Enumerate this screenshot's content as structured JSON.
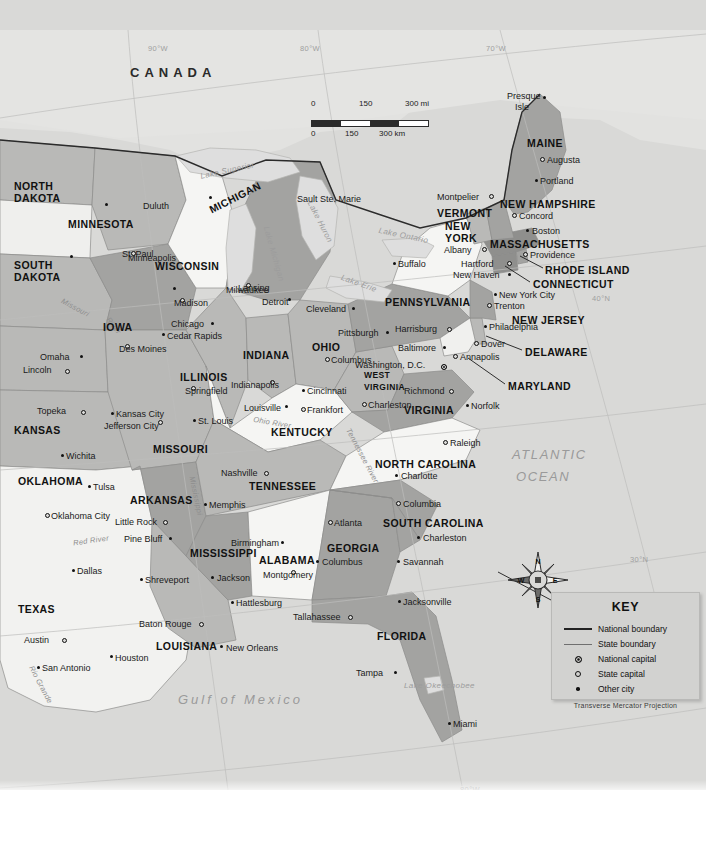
{
  "map": {
    "title_country": "CANADA",
    "oceans": [
      {
        "name": "ATLANTIC\nOCEAN",
        "line1": "ATLANTIC",
        "line2": "OCEAN",
        "x": 512,
        "y": 448
      },
      {
        "name": "Gulf of Mexico",
        "x": 178,
        "y": 693
      }
    ],
    "graticule_labels": [
      {
        "label": "90°W",
        "x": 148,
        "y": 45
      },
      {
        "label": "80°W",
        "x": 300,
        "y": 45
      },
      {
        "label": "70°W",
        "x": 486,
        "y": 45
      },
      {
        "label": "40°N",
        "x": 592,
        "y": 295
      },
      {
        "label": "30°N",
        "x": 630,
        "y": 556
      },
      {
        "label": "90°W",
        "x": 228,
        "y": 790
      },
      {
        "label": "80°W",
        "x": 460,
        "y": 786
      }
    ],
    "lakes": [
      {
        "label": "Lake Superior",
        "x": 200,
        "y": 167,
        "rot": -12
      },
      {
        "label": "Lake Michigan",
        "x": 245,
        "y": 250,
        "rot": 74
      },
      {
        "label": "Lake Huron",
        "x": 297,
        "y": 218,
        "rot": 63
      },
      {
        "label": "Lake Erie",
        "x": 340,
        "y": 280,
        "rot": 20
      },
      {
        "label": "Lake Ontario",
        "x": 378,
        "y": 232,
        "rot": 12
      },
      {
        "label": "Lake Okeechobee",
        "x": 404,
        "y": 682,
        "rot": 0
      }
    ],
    "rivers": [
      {
        "label": "Missouri",
        "x": 60,
        "y": 304,
        "rot": 28
      },
      {
        "label": "River",
        "x": 104,
        "y": 322,
        "rot": 52
      },
      {
        "label": "Mississippi",
        "x": 176,
        "y": 492,
        "rot": 78
      },
      {
        "label": "Ohio River",
        "x": 253,
        "y": 419,
        "rot": 10
      },
      {
        "label": "Tennessee River",
        "x": 332,
        "y": 452,
        "rot": 62
      },
      {
        "label": "Red River",
        "x": 73,
        "y": 537,
        "rot": -8
      },
      {
        "label": "Rio Grande",
        "x": 20,
        "y": 681,
        "rot": 62
      }
    ],
    "compass": {
      "n": "N",
      "e": "E",
      "s": "S",
      "w": "W",
      "x": 538,
      "y": 580
    }
  },
  "scale": {
    "miles": {
      "zero": "0",
      "mid": "150",
      "max": "300 mi"
    },
    "km": {
      "zero": "0",
      "mid": "150",
      "max": "300 km"
    }
  },
  "key": {
    "title": "KEY",
    "items": [
      {
        "symbol": "national-boundary-line",
        "label": "National boundary"
      },
      {
        "symbol": "state-boundary-line",
        "label": "State boundary"
      },
      {
        "symbol": "national-capital-dot",
        "label": "National capital"
      },
      {
        "symbol": "state-capital-dot",
        "label": "State capital"
      },
      {
        "symbol": "other-city-dot",
        "label": "Other city"
      }
    ],
    "projection": "Transverse Mercator Projection"
  },
  "states": [
    {
      "name": "NORTH\nDAKOTA",
      "l1": "NORTH",
      "l2": "DAKOTA",
      "x": 14,
      "y": 181,
      "two": true
    },
    {
      "name": "SOUTH\nDAKOTA",
      "l1": "SOUTH",
      "l2": "DAKOTA",
      "x": 14,
      "y": 260,
      "two": true
    },
    {
      "name": "MINNESOTA",
      "x": 68,
      "y": 219,
      "two": false
    },
    {
      "name": "WISCONSIN",
      "x": 155,
      "y": 261,
      "two": false
    },
    {
      "name": "MICHIGAN",
      "x": 210,
      "y": 205,
      "two": false,
      "rot": -27
    },
    {
      "name": "IOWA",
      "x": 103,
      "y": 322,
      "two": false
    },
    {
      "name": "ILLINOIS",
      "x": 180,
      "y": 372,
      "two": false
    },
    {
      "name": "INDIANA",
      "x": 243,
      "y": 350,
      "two": false
    },
    {
      "name": "OHIO",
      "x": 312,
      "y": 342,
      "two": false
    },
    {
      "name": "KANSAS",
      "x": 14,
      "y": 425,
      "two": false
    },
    {
      "name": "MISSOURI",
      "x": 153,
      "y": 444,
      "two": false
    },
    {
      "name": "KENTUCKY",
      "x": 271,
      "y": 427,
      "two": false
    },
    {
      "name": "WEST\nVIRGINIA",
      "l1": "WEST",
      "l2": "VIRGINIA",
      "x": 364,
      "y": 371,
      "two": true,
      "small": true
    },
    {
      "name": "VIRGINIA",
      "x": 404,
      "y": 405,
      "two": false
    },
    {
      "name": "PENNSYLVANIA",
      "x": 385,
      "y": 297,
      "two": false
    },
    {
      "name": "NEW\nYORK",
      "l1": "NEW",
      "l2": "YORK",
      "x": 445,
      "y": 221,
      "two": true
    },
    {
      "name": "VERMONT",
      "x": 437,
      "y": 208,
      "two": false
    },
    {
      "name": "NEW HAMPSHIRE",
      "x": 500,
      "y": 199,
      "two": false
    },
    {
      "name": "MAINE",
      "x": 527,
      "y": 138,
      "two": false
    },
    {
      "name": "MASSACHUSETTS",
      "x": 490,
      "y": 239,
      "two": false
    },
    {
      "name": "RHODE ISLAND",
      "x": 545,
      "y": 265,
      "two": false
    },
    {
      "name": "CONNECTICUT",
      "x": 533,
      "y": 279,
      "two": false
    },
    {
      "name": "NEW JERSEY",
      "x": 512,
      "y": 315,
      "two": false
    },
    {
      "name": "DELAWARE",
      "x": 525,
      "y": 347,
      "two": false
    },
    {
      "name": "MARYLAND",
      "x": 508,
      "y": 381,
      "two": false
    },
    {
      "name": "NORTH CAROLINA",
      "x": 375,
      "y": 459,
      "two": false
    },
    {
      "name": "SOUTH CAROLINA",
      "x": 383,
      "y": 518,
      "two": false
    },
    {
      "name": "GEORGIA",
      "x": 327,
      "y": 543,
      "two": false
    },
    {
      "name": "FLORIDA",
      "x": 377,
      "y": 631,
      "two": false
    },
    {
      "name": "TENNESSEE",
      "x": 249,
      "y": 481,
      "two": false
    },
    {
      "name": "ALABAMA",
      "x": 259,
      "y": 555,
      "two": false
    },
    {
      "name": "MISSISSIPPI",
      "x": 190,
      "y": 548,
      "two": false
    },
    {
      "name": "LOUISIANA",
      "x": 156,
      "y": 641,
      "two": false
    },
    {
      "name": "ARKANSAS",
      "x": 130,
      "y": 495,
      "two": false
    },
    {
      "name": "OKLAHOMA",
      "x": 18,
      "y": 476,
      "two": false
    },
    {
      "name": "TEXAS",
      "x": 18,
      "y": 604,
      "two": false
    }
  ],
  "cities": [
    {
      "name": "Duluth",
      "type": "other",
      "x": 105,
      "y": 203,
      "dx": 38,
      "dy": 4
    },
    {
      "name": "Sault Ste. Marie",
      "type": "other",
      "x": 209,
      "y": 196,
      "dx": 88,
      "dy": 4
    },
    {
      "name": "Minneapolis",
      "type": "other",
      "x": 70,
      "y": 255,
      "dx": 58,
      "dy": 4
    },
    {
      "name": "St. Paul",
      "type": "state",
      "x": 131,
      "y": 251,
      "dx": -9,
      "dy": 4
    },
    {
      "name": "Milwaukee",
      "type": "other",
      "x": 173,
      "y": 287,
      "dx": 53,
      "dy": 4
    },
    {
      "name": "Madison",
      "type": "state",
      "x": 180,
      "y": 298,
      "dx": -6,
      "dy": 6
    },
    {
      "name": "Lansing",
      "type": "state",
      "x": 246,
      "y": 283,
      "dx": -8,
      "dy": 6
    },
    {
      "name": "Detroit",
      "type": "other",
      "x": 288,
      "y": 298,
      "dx": -26,
      "dy": 5
    },
    {
      "name": "Chicago",
      "type": "other",
      "x": 211,
      "y": 322,
      "dx": -40,
      "dy": 3
    },
    {
      "name": "Cedar Rapids",
      "type": "other",
      "x": 162,
      "y": 333,
      "dx": 5,
      "dy": 4
    },
    {
      "name": "Des Moines",
      "type": "state",
      "x": 125,
      "y": 344,
      "dx": -6,
      "dy": 6
    },
    {
      "name": "Omaha",
      "type": "other",
      "x": 80,
      "y": 355,
      "dx": -40,
      "dy": 3
    },
    {
      "name": "Lincoln",
      "type": "state",
      "x": 65,
      "y": 369,
      "dx": -42,
      "dy": 2
    },
    {
      "name": "Topeka",
      "type": "state",
      "x": 81,
      "y": 410,
      "dx": -44,
      "dy": 2
    },
    {
      "name": "Kansas City",
      "type": "other",
      "x": 111,
      "y": 412,
      "dx": 5,
      "dy": 3
    },
    {
      "name": "Jefferson City",
      "type": "state",
      "x": 158,
      "y": 420,
      "dx": -54,
      "dy": 7
    },
    {
      "name": "St. Louis",
      "type": "other",
      "x": 193,
      "y": 419,
      "dx": 5,
      "dy": 3
    },
    {
      "name": "Springfield",
      "type": "state",
      "x": 191,
      "y": 386,
      "dx": -6,
      "dy": 6
    },
    {
      "name": "Wichita",
      "type": "other",
      "x": 61,
      "y": 454,
      "dx": 5,
      "dy": 3
    },
    {
      "name": "Indianapolis",
      "type": "state",
      "x": 270,
      "y": 380,
      "dx": -39,
      "dy": 6
    },
    {
      "name": "Cincinnati",
      "type": "other",
      "x": 302,
      "y": 389,
      "dx": 5,
      "dy": 3
    },
    {
      "name": "Louisville",
      "type": "other",
      "x": 285,
      "y": 405,
      "dx": -41,
      "dy": 4
    },
    {
      "name": "Frankfort",
      "type": "state",
      "x": 301,
      "y": 407,
      "dx": 6,
      "dy": 4
    },
    {
      "name": "Columbus",
      "type": "state",
      "x": 325,
      "y": 357,
      "dx": 6,
      "dy": 4
    },
    {
      "name": "Charleston",
      "type": "state",
      "x": 362,
      "y": 402,
      "dx": 6,
      "dy": 4
    },
    {
      "name": "Nashville",
      "type": "state",
      "x": 264,
      "y": 471,
      "dx": -43,
      "dy": 3
    },
    {
      "name": "Memphis",
      "type": "other",
      "x": 204,
      "y": 503,
      "dx": 5,
      "dy": 3
    },
    {
      "name": "Little Rock",
      "type": "state",
      "x": 163,
      "y": 520,
      "dx": -48,
      "dy": 3
    },
    {
      "name": "Pine Bluff",
      "type": "other",
      "x": 169,
      "y": 537,
      "dx": -45,
      "dy": 3
    },
    {
      "name": "Tulsa",
      "type": "other",
      "x": 88,
      "y": 485,
      "dx": 5,
      "dy": 3
    },
    {
      "name": "Oklahoma City",
      "type": "state",
      "x": 45,
      "y": 513,
      "dx": 6,
      "dy": 4
    },
    {
      "name": "Dallas",
      "type": "other",
      "x": 72,
      "y": 569,
      "dx": 5,
      "dy": 3
    },
    {
      "name": "Austin",
      "type": "state",
      "x": 62,
      "y": 638,
      "dx": -38,
      "dy": 3
    },
    {
      "name": "San Antonio",
      "type": "other",
      "x": 37,
      "y": 666,
      "dx": 5,
      "dy": 3
    },
    {
      "name": "Houston",
      "type": "other",
      "x": 110,
      "y": 655,
      "dx": 5,
      "dy": 4
    },
    {
      "name": "Shreveport",
      "type": "other",
      "x": 140,
      "y": 578,
      "dx": 5,
      "dy": 3
    },
    {
      "name": "Baton Rouge",
      "type": "state",
      "x": 199,
      "y": 622,
      "dx": -60,
      "dy": 3
    },
    {
      "name": "New Orleans",
      "type": "other",
      "x": 220,
      "y": 645,
      "dx": 6,
      "dy": 4
    },
    {
      "name": "Jackson",
      "type": "other",
      "x": 211,
      "y": 576,
      "dx": 6,
      "dy": 3
    },
    {
      "name": "Birmingham",
      "type": "other",
      "x": 281,
      "y": 541,
      "dx": -50,
      "dy": 3
    },
    {
      "name": "Montgomery",
      "type": "state",
      "x": 291,
      "y": 570,
      "dx": -28,
      "dy": 6
    },
    {
      "name": "Hattlesburg",
      "type": "other",
      "x": 231,
      "y": 601,
      "dx": 5,
      "dy": 3
    },
    {
      "name": "Tallahassee",
      "type": "state",
      "x": 348,
      "y": 615,
      "dx": -55,
      "dy": 3
    },
    {
      "name": "Jacksonville",
      "type": "other",
      "x": 398,
      "y": 600,
      "dx": 5,
      "dy": 3
    },
    {
      "name": "Tampa",
      "type": "other",
      "x": 394,
      "y": 671,
      "dx": -38,
      "dy": 3
    },
    {
      "name": "Miami",
      "type": "other",
      "x": 448,
      "y": 722,
      "dx": 5,
      "dy": 3
    },
    {
      "name": "Atlanta",
      "type": "state",
      "x": 328,
      "y": 520,
      "dx": 6,
      "dy": 4
    },
    {
      "name": "Columbus",
      "type": "other",
      "x": 316,
      "y": 560,
      "dx": 6,
      "dy": 3
    },
    {
      "name": "Savannah",
      "type": "other",
      "x": 397,
      "y": 560,
      "dx": 6,
      "dy": 3
    },
    {
      "name": "Charleston",
      "type": "other",
      "x": 417,
      "y": 536,
      "dx": 6,
      "dy": 3
    },
    {
      "name": "Columbia",
      "type": "state",
      "x": 396,
      "y": 501,
      "dx": 7,
      "dy": 4
    },
    {
      "name": "Charlotte",
      "type": "other",
      "x": 395,
      "y": 474,
      "dx": 6,
      "dy": 3
    },
    {
      "name": "Raleigh",
      "type": "state",
      "x": 443,
      "y": 440,
      "dx": 7,
      "dy": 4
    },
    {
      "name": "Richmond",
      "type": "state",
      "x": 449,
      "y": 389,
      "dx": -45,
      "dy": 3
    },
    {
      "name": "Norfolk",
      "type": "other",
      "x": 466,
      "y": 404,
      "dx": 5,
      "dy": 3
    },
    {
      "name": "Washington, D.C.",
      "type": "natl",
      "x": 441,
      "y": 364,
      "dx": -86,
      "dy": 2
    },
    {
      "name": "Annapolis",
      "type": "state",
      "x": 453,
      "y": 354,
      "dx": 7,
      "dy": 4
    },
    {
      "name": "Baltimore",
      "type": "other",
      "x": 443,
      "y": 346,
      "dx": -45,
      "dy": 3
    },
    {
      "name": "Dover",
      "type": "state",
      "x": 474,
      "y": 341,
      "dx": 7,
      "dy": 4
    },
    {
      "name": "Harrisburg",
      "type": "state",
      "x": 447,
      "y": 327,
      "dx": -52,
      "dy": 3
    },
    {
      "name": "Pittsburgh",
      "type": "other",
      "x": 386,
      "y": 331,
      "dx": -48,
      "dy": 3
    },
    {
      "name": "Cleveland",
      "type": "other",
      "x": 352,
      "y": 307,
      "dx": -46,
      "dy": 3
    },
    {
      "name": "Philadelphia",
      "type": "other",
      "x": 484,
      "y": 325,
      "dx": 5,
      "dy": 3
    },
    {
      "name": "Trenton",
      "type": "state",
      "x": 487,
      "y": 303,
      "dx": 7,
      "dy": 4
    },
    {
      "name": "New York City",
      "type": "other",
      "x": 494,
      "y": 293,
      "dx": 5,
      "dy": 3
    },
    {
      "name": "New Haven",
      "type": "other",
      "x": 508,
      "y": 273,
      "dx": -55,
      "dy": 3
    },
    {
      "name": "Hartford",
      "type": "state",
      "x": 507,
      "y": 261,
      "dx": -46,
      "dy": 4
    },
    {
      "name": "Providence",
      "type": "state",
      "x": 523,
      "y": 252,
      "dx": 7,
      "dy": 4
    },
    {
      "name": "Boston",
      "type": "other",
      "x": 526,
      "y": 229,
      "dx": 6,
      "dy": 3
    },
    {
      "name": "Albany",
      "type": "state",
      "x": 482,
      "y": 247,
      "dx": -38,
      "dy": 4
    },
    {
      "name": "Buffalo",
      "type": "other",
      "x": 393,
      "y": 262,
      "dx": 5,
      "dy": 3
    },
    {
      "name": "Concord",
      "type": "state",
      "x": 512,
      "y": 213,
      "dx": 7,
      "dy": 4
    },
    {
      "name": "Montpelier",
      "type": "state",
      "x": 489,
      "y": 194,
      "dx": -52,
      "dy": 4
    },
    {
      "name": "Augusta",
      "type": "state",
      "x": 540,
      "y": 157,
      "dx": 7,
      "dy": 4
    },
    {
      "name": "Portland",
      "type": "other",
      "x": 535,
      "y": 179,
      "dx": 5,
      "dy": 3
    },
    {
      "name": "Presque\nIsle",
      "l1": "Presque",
      "l2": "Isle",
      "type": "other",
      "x": 543,
      "y": 96,
      "dx": -36,
      "dy": 2
    }
  ]
}
